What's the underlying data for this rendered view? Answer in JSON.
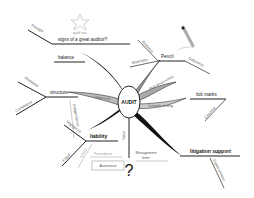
{
  "diagram": {
    "type": "mind-map",
    "center": {
      "label": "AUDIT"
    },
    "top": {
      "star_caption": "gold star",
      "title": "signs of a great auditor?",
      "left_branch": "Prestige",
      "balance": "balance"
    },
    "pencil_cluster": {
      "main": "Pencil",
      "branches": [
        "Materiality",
        "Evidence",
        "Substance"
      ]
    },
    "left_cluster": {
      "main": "structure",
      "branches": [
        "Standards",
        "Compliance",
        "Independence"
      ],
      "petal": "Objectives"
    },
    "liability_cluster": {
      "main": "liability",
      "branches": [
        "Negligence",
        "Fraud",
        "Ethics"
      ],
      "box": "Assurance"
    },
    "right_cluster": {
      "upper_petal": "Risk assessment",
      "lower_petal": "Controls testing",
      "tick": "tick marks",
      "tick_branch": "Checklist"
    },
    "bottom_right": {
      "main": "litigation support",
      "branch": "Expert witness"
    },
    "bottom": {
      "vertical": "Value",
      "left_faint": "Procedures",
      "management": [
        "Management",
        "letter"
      ],
      "question": "?"
    }
  }
}
